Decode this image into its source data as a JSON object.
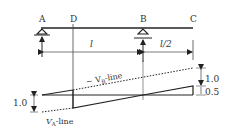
{
  "diagram": {
    "points": [
      {
        "id": "A",
        "label": "A"
      },
      {
        "id": "D",
        "label": "D"
      },
      {
        "id": "B",
        "label": "B"
      },
      {
        "id": "C",
        "label": "C"
      }
    ],
    "dimensions": {
      "AB": "l",
      "BC": "l/2"
    },
    "lines": {
      "neg_vb_label": "− V",
      "neg_vb_sub": "B",
      "neg_vb_suffix": "-line",
      "va_label": "V",
      "va_sub": "A",
      "va_suffix": "-line"
    },
    "values": {
      "left_ordinate": "1.0",
      "right_upper": "1.0",
      "right_lower": "0.5"
    },
    "colors": {
      "line": "#222222",
      "text": "#333333"
    }
  }
}
